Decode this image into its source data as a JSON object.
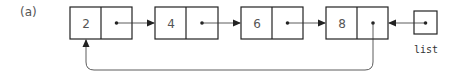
{
  "figure": {
    "label": "(a)",
    "pointer_name": "list",
    "nodes": [
      {
        "value": "2"
      },
      {
        "value": "4"
      },
      {
        "value": "6"
      },
      {
        "value": "8"
      }
    ],
    "structure": "circular singly linked list; list points to last node (8), whose next points back to first node (2)"
  }
}
